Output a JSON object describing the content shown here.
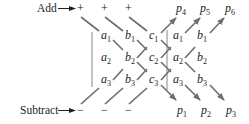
{
  "diagram": {
    "title": "",
    "labels": {
      "add": "Add",
      "subtract": "Subtract",
      "plus": "+",
      "minus": "−"
    },
    "matrix": {
      "rows": [
        [
          {
            "v": "a",
            "s": "1"
          },
          {
            "v": "b",
            "s": "1"
          },
          {
            "v": "c",
            "s": "1"
          },
          {
            "v": "a",
            "s": "1"
          },
          {
            "v": "b",
            "s": "1"
          }
        ],
        [
          {
            "v": "a",
            "s": "2"
          },
          {
            "v": "b",
            "s": "2"
          },
          {
            "v": "c",
            "s": "2"
          },
          {
            "v": "a",
            "s": "2"
          },
          {
            "v": "b",
            "s": "2"
          }
        ],
        [
          {
            "v": "a",
            "s": "3"
          },
          {
            "v": "b",
            "s": "3"
          },
          {
            "v": "c",
            "s": "3"
          },
          {
            "v": "a",
            "s": "3"
          },
          {
            "v": "b",
            "s": "3"
          }
        ]
      ]
    },
    "products_top": [
      {
        "v": "p",
        "s": "4"
      },
      {
        "v": "p",
        "s": "5"
      },
      {
        "v": "p",
        "s": "6"
      }
    ],
    "products_bottom": [
      {
        "v": "p",
        "s": "1"
      },
      {
        "v": "p",
        "s": "2"
      },
      {
        "v": "p",
        "s": "3"
      }
    ],
    "colors": {
      "text": "#231f20",
      "diagonal": "#6d6e71",
      "divider": "#a7a9ac"
    }
  }
}
